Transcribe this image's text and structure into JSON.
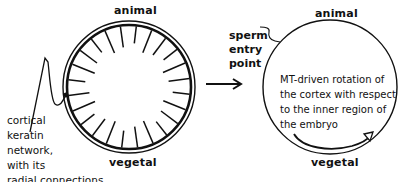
{
  "left_embryo": {
    "top_label": "animal",
    "bottom_label": "vegetal",
    "annotation_lines": [
      "cortical",
      "keratin",
      "network,",
      "with its",
      "radial connections"
    ],
    "spoke_count": 24
  },
  "transition_arrow": {
    "direction": "right"
  },
  "right_embryo": {
    "top_label": "animal",
    "bottom_label": "vegetal",
    "sperm_entry_lines": [
      "sperm",
      "entry",
      "point"
    ],
    "description_lines": [
      "MT-driven rotation of",
      "the cortex with respect",
      "to the inner region of",
      "the embryo"
    ],
    "rotation_arrow": "curved-clockwise-to-right"
  },
  "colors": {
    "stroke": "#111111",
    "background": "#ffffff"
  }
}
